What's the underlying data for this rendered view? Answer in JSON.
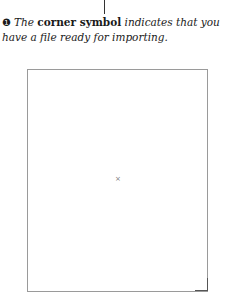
{
  "caption": {
    "step_marker": "❶",
    "text_before": "The ",
    "bold_term": "corner symbol",
    "text_after": " indicates that you have a file ready for importing."
  },
  "frame": {
    "center_marker": "×",
    "corner_icon": "corner-symbol-icon"
  }
}
